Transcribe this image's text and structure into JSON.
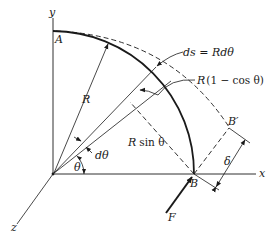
{
  "figure": {
    "labels": {
      "y_axis": "y",
      "x_axis": "x",
      "z_axis": "z",
      "point_a": "A",
      "point_b": "B",
      "point_b_prime": "B′",
      "radius": "R",
      "arc_element": "ds = Rdθ",
      "r_one_minus_cos_prefix": "R",
      "r_one_minus_cos_rest": "(1 − cos θ)",
      "r_sin_prefix": "R",
      "r_sin_rest": "sin θ",
      "d_theta": "dθ",
      "theta": "θ",
      "delta": "δ",
      "force": "F"
    },
    "colors": {
      "ink": "#1a1a1a",
      "background": "#ffffff"
    }
  }
}
